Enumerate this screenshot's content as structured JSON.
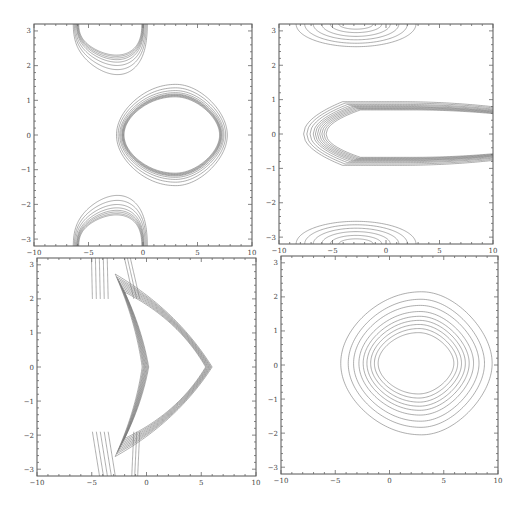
{
  "chart_data": [
    {
      "type": "contour",
      "panel": "top-left",
      "title": "",
      "xlabel": "",
      "ylabel": "",
      "xlim": [
        -10,
        10
      ],
      "ylim": [
        -3.2,
        3.2
      ],
      "xticks": [
        -10,
        -5,
        0,
        5,
        10
      ],
      "yticks": [
        -3,
        -2,
        -1,
        0,
        1,
        2,
        3
      ],
      "families": [
        {
          "name": "central-rounded-triangle",
          "shape": "trilobe",
          "cx": 2.6,
          "cy": 0.0,
          "levels": [
            {
              "rx": 4.4,
              "ry": 1.1,
              "skew": 0.3
            },
            {
              "rx": 4.45,
              "ry": 1.12,
              "skew": 0.3
            },
            {
              "rx": 4.5,
              "ry": 1.14,
              "skew": 0.3
            },
            {
              "rx": 4.55,
              "ry": 1.16,
              "skew": 0.3
            },
            {
              "rx": 4.6,
              "ry": 1.18,
              "skew": 0.3
            },
            {
              "rx": 4.7,
              "ry": 1.22,
              "skew": 0.3
            },
            {
              "rx": 4.8,
              "ry": 1.28,
              "skew": 0.3
            },
            {
              "rx": 4.95,
              "ry": 1.36,
              "skew": 0.3
            },
            {
              "rx": 5.1,
              "ry": 1.46,
              "skew": 0.3
            }
          ]
        },
        {
          "name": "top-partial-triangle",
          "shape": "cap-down",
          "cx": -3.0,
          "cy": 3.2,
          "levels": [
            {
              "rx": 2.9,
              "ry": 0.75
            },
            {
              "rx": 2.95,
              "ry": 0.78
            },
            {
              "rx": 3.0,
              "ry": 0.82
            },
            {
              "rx": 3.05,
              "ry": 0.86
            },
            {
              "rx": 3.1,
              "ry": 0.92
            },
            {
              "rx": 3.2,
              "ry": 1.0
            },
            {
              "rx": 3.3,
              "ry": 1.1
            },
            {
              "rx": 3.4,
              "ry": 1.22
            }
          ]
        },
        {
          "name": "bottom-partial-triangle",
          "shape": "cap-up",
          "cx": -3.0,
          "cy": -3.2,
          "levels": [
            {
              "rx": 2.9,
              "ry": 0.75
            },
            {
              "rx": 2.95,
              "ry": 0.78
            },
            {
              "rx": 3.0,
              "ry": 0.82
            },
            {
              "rx": 3.05,
              "ry": 0.86
            },
            {
              "rx": 3.1,
              "ry": 0.92
            },
            {
              "rx": 3.2,
              "ry": 1.0
            },
            {
              "rx": 3.3,
              "ry": 1.1
            },
            {
              "rx": 3.4,
              "ry": 1.22
            }
          ]
        }
      ]
    },
    {
      "type": "contour",
      "panel": "top-right",
      "title": "",
      "xlabel": "",
      "ylabel": "",
      "xlim": [
        -10,
        10
      ],
      "ylim": [
        -3.2,
        3.2
      ],
      "xticks": [
        -10,
        -5,
        0,
        5,
        10
      ],
      "yticks": [
        -3,
        -2,
        -1,
        0,
        1,
        2,
        3
      ],
      "families": [
        {
          "name": "central-elongated-loop",
          "shape": "open-right",
          "x0": -5.2,
          "xend": 10,
          "levels": [
            {
              "x0": -5.6,
              "ry": 0.7
            },
            {
              "x0": -5.8,
              "ry": 0.72
            },
            {
              "x0": -6.0,
              "ry": 0.74
            },
            {
              "x0": -6.2,
              "ry": 0.76
            },
            {
              "x0": -6.4,
              "ry": 0.78
            },
            {
              "x0": -6.6,
              "ry": 0.8
            },
            {
              "x0": -6.8,
              "ry": 0.83
            },
            {
              "x0": -7.1,
              "ry": 0.86
            },
            {
              "x0": -7.4,
              "ry": 0.9
            },
            {
              "x0": -7.7,
              "ry": 0.94
            }
          ]
        },
        {
          "name": "top-half-ellipses",
          "shape": "half-ellipse-down",
          "cx": -2.8,
          "cy": 3.2,
          "levels": [
            {
              "rx": 1.6,
              "ry": 0.15
            },
            {
              "rx": 2.4,
              "ry": 0.25
            },
            {
              "rx": 3.2,
              "ry": 0.36
            },
            {
              "rx": 4.0,
              "ry": 0.46
            },
            {
              "rx": 4.8,
              "ry": 0.56
            },
            {
              "rx": 5.6,
              "ry": 0.66
            }
          ]
        },
        {
          "name": "bottom-half-ellipses",
          "shape": "half-ellipse-up",
          "cx": -2.8,
          "cy": -3.2,
          "levels": [
            {
              "rx": 1.6,
              "ry": 0.15
            },
            {
              "rx": 2.4,
              "ry": 0.25
            },
            {
              "rx": 3.2,
              "ry": 0.36
            },
            {
              "rx": 4.0,
              "ry": 0.46
            },
            {
              "rx": 4.8,
              "ry": 0.56
            },
            {
              "rx": 5.6,
              "ry": 0.66
            }
          ]
        }
      ]
    },
    {
      "type": "contour",
      "panel": "bottom-left",
      "title": "",
      "xlabel": "",
      "ylabel": "",
      "xlim": [
        -10,
        10
      ],
      "ylim": [
        -3.2,
        3.2
      ],
      "xticks": [
        -10,
        -5,
        0,
        5,
        10
      ],
      "yticks": [
        -3,
        -2,
        -1,
        0,
        1,
        2,
        3
      ],
      "families": [
        {
          "name": "chevron-loop",
          "shape": "chevron",
          "vertices": {
            "left": [
              0.2,
              0.0
            ],
            "right": [
              5.4,
              0.0
            ],
            "top": [
              -2.0,
              2.2
            ],
            "bottom": [
              -2.0,
              -2.1
            ]
          },
          "levels": [
            0.0,
            0.08,
            0.16,
            0.24,
            0.32,
            0.4,
            0.48,
            0.56,
            0.66
          ]
        },
        {
          "name": "tail-lines",
          "shape": "tails",
          "offsets": [
            -2.6,
            -2.2,
            -1.8,
            -1.4,
            -1.0,
            0.6,
            0.9,
            1.2
          ]
        }
      ]
    },
    {
      "type": "contour",
      "panel": "bottom-right",
      "title": "",
      "xlabel": "",
      "ylabel": "",
      "xlim": [
        -10,
        10
      ],
      "ylim": [
        -3.2,
        3.2
      ],
      "xticks": [
        -10,
        -5,
        0,
        5,
        10
      ],
      "yticks": [
        -3,
        -2,
        -1,
        0,
        1,
        2,
        3
      ],
      "families": [
        {
          "name": "nested-rounded-triangles",
          "shape": "trilobe",
          "cx": 2.4,
          "cy": 0.05,
          "levels": [
            {
              "rx": 3.5,
              "ry": 0.9,
              "skew": 0.28
            },
            {
              "rx": 3.85,
              "ry": 1.02,
              "skew": 0.28
            },
            {
              "rx": 4.2,
              "ry": 1.14,
              "skew": 0.28
            },
            {
              "rx": 4.55,
              "ry": 1.26,
              "skew": 0.28
            },
            {
              "rx": 4.9,
              "ry": 1.38,
              "skew": 0.28
            },
            {
              "rx": 5.3,
              "ry": 1.52,
              "skew": 0.28
            },
            {
              "rx": 5.8,
              "ry": 1.7,
              "skew": 0.28
            },
            {
              "rx": 6.3,
              "ry": 1.88,
              "skew": 0.28
            },
            {
              "rx": 7.0,
              "ry": 2.1,
              "skew": 0.28
            }
          ]
        }
      ]
    }
  ]
}
